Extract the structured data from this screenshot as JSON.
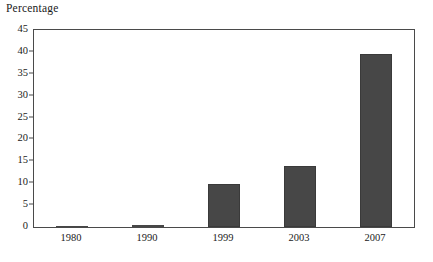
{
  "chart_data": {
    "type": "bar",
    "title": "",
    "xlabel": "",
    "ylabel": "Percentage",
    "categories": [
      "1980",
      "1990",
      "1999",
      "2003",
      "2007"
    ],
    "values": [
      0.3,
      0.5,
      9.8,
      14.0,
      39.5
    ],
    "ylim": [
      0,
      45
    ],
    "ytick_step": 5,
    "yticks": [
      "0",
      "5",
      "10",
      "15",
      "20",
      "25",
      "30",
      "35",
      "40",
      "45"
    ],
    "grid": false,
    "legend": null,
    "bar_color": "#474747",
    "axis_color": "#4a4a4a",
    "background_color": "#ffffff"
  }
}
